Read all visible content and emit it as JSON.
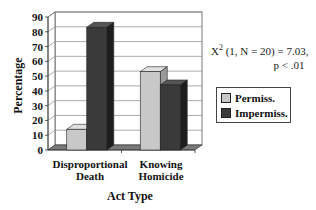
{
  "chart_data": {
    "type": "bar",
    "style": "3d-clustered",
    "title": "",
    "xlabel": "Act Type",
    "ylabel": "Percentage",
    "ylim": [
      0,
      90
    ],
    "yticks": [
      0,
      10,
      20,
      30,
      40,
      50,
      60,
      70,
      80,
      90
    ],
    "grid": true,
    "categories": [
      "Disproportional Death",
      "Knowing Homicide"
    ],
    "category_lines": [
      [
        "Disproportional",
        "Death"
      ],
      [
        "Knowing",
        "Homicide"
      ]
    ],
    "series": [
      {
        "name": "Permiss.",
        "color": "#c8c8c8",
        "values": [
          14,
          53
        ]
      },
      {
        "name": "Impermiss.",
        "color": "#3a3a3a",
        "values": [
          83,
          44
        ]
      }
    ],
    "legend_position": "right",
    "annotation": {
      "stat": "X",
      "sup": "2",
      "rest": " (1, N = 20) = 7.03,",
      "p": "p < .01"
    }
  }
}
